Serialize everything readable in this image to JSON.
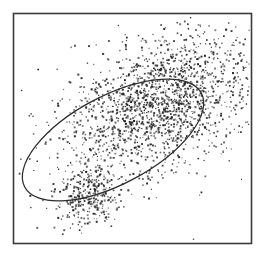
{
  "figure": {
    "title": "",
    "background_color": "#ffffff",
    "width": 266,
    "height": 259
  },
  "frame": {
    "label": "plot border frame",
    "x": 13.5,
    "y": 13.5,
    "width": 238,
    "height": 230,
    "stroke_color": "#3b3b3b",
    "stroke_width": 1.6
  },
  "chart_data": {
    "type": "scatter",
    "title": "",
    "subtitle": "",
    "xlabel": "",
    "ylabel": "",
    "xlim": [
      13,
      252
    ],
    "ylim": [
      13,
      244
    ],
    "grid": false,
    "legend": "none",
    "tick_labels_x": [],
    "tick_labels_y": [],
    "annotations": [],
    "point_color": "#2e2e2e",
    "point_size_px": 1.35,
    "total_points": 2150,
    "series": [
      {
        "name": "main-cloud",
        "kind": "gaussian-cluster",
        "n": 1760,
        "center": [
          158,
          103
        ],
        "sigma_major": 52,
        "sigma_minor": 30,
        "angle_deg": -27,
        "radial_falloff": 1.0
      },
      {
        "name": "secondary-cluster",
        "kind": "gaussian-cluster",
        "n": 295,
        "center": [
          88,
          197
        ],
        "sigma_major": 16,
        "sigma_minor": 14,
        "angle_deg": -20,
        "radial_falloff": 1.0
      },
      {
        "name": "sparse-halo",
        "kind": "gaussian-cluster",
        "n": 95,
        "center": [
          165,
          95
        ],
        "sigma_major": 78,
        "sigma_minor": 52,
        "angle_deg": -27,
        "radial_falloff": 1.0
      }
    ],
    "overlay_ellipse": {
      "name": "confidence-ellipse",
      "center_x": 113,
      "center_y": 140,
      "radius_major": 100,
      "radius_minor": 44,
      "rotation_deg": -28,
      "stroke_color": "#2b2b2b",
      "stroke_width": 1.25
    },
    "random_seed": 20240517
  }
}
